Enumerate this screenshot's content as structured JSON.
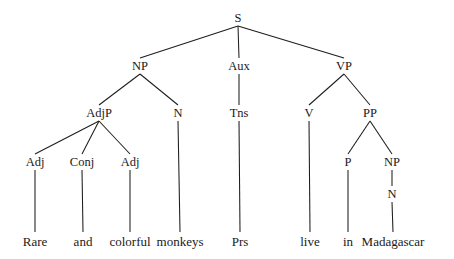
{
  "diagram": {
    "type": "syntax-tree",
    "sentence": "Rare and colorful monkeys Prs live in Madagascar",
    "background_color": "#ffffff",
    "line_color": "#1d1d1d",
    "text_color": "#1a1a1a",
    "width": 454,
    "height": 259,
    "nodes": [
      {
        "id": "S",
        "label": "S",
        "kind": "category",
        "x": 238,
        "y": 18,
        "level": 0
      },
      {
        "id": "NP1",
        "label": "NP",
        "kind": "category",
        "x": 140,
        "y": 66,
        "level": 1
      },
      {
        "id": "Aux",
        "label": "Aux",
        "kind": "category",
        "x": 239,
        "y": 66,
        "level": 1
      },
      {
        "id": "VP",
        "label": "VP",
        "kind": "category",
        "x": 344,
        "y": 66,
        "level": 1
      },
      {
        "id": "AdjP",
        "label": "AdjP",
        "kind": "category",
        "x": 99,
        "y": 113,
        "level": 2
      },
      {
        "id": "N1",
        "label": "N",
        "kind": "category",
        "x": 178,
        "y": 113,
        "level": 2
      },
      {
        "id": "Tns",
        "label": "Tns",
        "kind": "category",
        "x": 239,
        "y": 113,
        "level": 2
      },
      {
        "id": "V",
        "label": "V",
        "kind": "category",
        "x": 309,
        "y": 113,
        "level": 2
      },
      {
        "id": "PP",
        "label": "PP",
        "kind": "category",
        "x": 370,
        "y": 113,
        "level": 2
      },
      {
        "id": "Adj1",
        "label": "Adj",
        "kind": "category",
        "x": 35,
        "y": 162,
        "level": 3
      },
      {
        "id": "Conj",
        "label": "Conj",
        "kind": "category",
        "x": 82,
        "y": 162,
        "level": 3
      },
      {
        "id": "Adj2",
        "label": "Adj",
        "kind": "category",
        "x": 130,
        "y": 162,
        "level": 3
      },
      {
        "id": "P",
        "label": "P",
        "kind": "category",
        "x": 348,
        "y": 162,
        "level": 3
      },
      {
        "id": "NP2",
        "label": "NP",
        "kind": "category",
        "x": 392,
        "y": 162,
        "level": 3
      },
      {
        "id": "N2",
        "label": "N",
        "kind": "category",
        "x": 392,
        "y": 194,
        "level": 4
      },
      {
        "id": "w_rare",
        "label": "Rare",
        "kind": "terminal",
        "x": 35,
        "y": 241,
        "level": 5
      },
      {
        "id": "w_and",
        "label": "and",
        "kind": "terminal",
        "x": 83,
        "y": 241,
        "level": 5
      },
      {
        "id": "w_colorful",
        "label": "colorful",
        "kind": "terminal",
        "x": 130,
        "y": 241,
        "level": 5
      },
      {
        "id": "w_monkeys",
        "label": "monkeys",
        "kind": "terminal",
        "x": 180,
        "y": 241,
        "level": 5
      },
      {
        "id": "w_prs",
        "label": "Prs",
        "kind": "terminal",
        "x": 240,
        "y": 241,
        "level": 5
      },
      {
        "id": "w_live",
        "label": "live",
        "kind": "terminal",
        "x": 310,
        "y": 241,
        "level": 5
      },
      {
        "id": "w_in",
        "label": "in",
        "kind": "terminal",
        "x": 348,
        "y": 241,
        "level": 5
      },
      {
        "id": "w_madagascar",
        "label": "Madagascar",
        "kind": "terminal",
        "x": 393,
        "y": 241,
        "level": 5
      }
    ],
    "edges": [
      {
        "from": "S",
        "to": "NP1",
        "x1": 238,
        "y1": 26,
        "x2": 140,
        "y2": 58
      },
      {
        "from": "S",
        "to": "Aux",
        "x1": 238,
        "y1": 26,
        "x2": 239,
        "y2": 58
      },
      {
        "from": "S",
        "to": "VP",
        "x1": 238,
        "y1": 26,
        "x2": 344,
        "y2": 58
      },
      {
        "from": "NP1",
        "to": "AdjP",
        "x1": 140,
        "y1": 74,
        "x2": 99,
        "y2": 105
      },
      {
        "from": "NP1",
        "to": "N1",
        "x1": 140,
        "y1": 74,
        "x2": 178,
        "y2": 105
      },
      {
        "from": "Aux",
        "to": "Tns",
        "x1": 239,
        "y1": 74,
        "x2": 239,
        "y2": 105
      },
      {
        "from": "VP",
        "to": "V",
        "x1": 344,
        "y1": 74,
        "x2": 309,
        "y2": 105
      },
      {
        "from": "VP",
        "to": "PP",
        "x1": 344,
        "y1": 74,
        "x2": 370,
        "y2": 105
      },
      {
        "from": "AdjP",
        "to": "Adj1",
        "x1": 99,
        "y1": 121,
        "x2": 35,
        "y2": 154
      },
      {
        "from": "AdjP",
        "to": "Conj",
        "x1": 99,
        "y1": 121,
        "x2": 82,
        "y2": 154
      },
      {
        "from": "AdjP",
        "to": "Adj2",
        "x1": 99,
        "y1": 121,
        "x2": 130,
        "y2": 154
      },
      {
        "from": "N1",
        "to": "w_monkeys",
        "x1": 178,
        "y1": 121,
        "x2": 180,
        "y2": 232
      },
      {
        "from": "Tns",
        "to": "w_prs",
        "x1": 239,
        "y1": 121,
        "x2": 240,
        "y2": 232
      },
      {
        "from": "V",
        "to": "w_live",
        "x1": 309,
        "y1": 121,
        "x2": 310,
        "y2": 232
      },
      {
        "from": "PP",
        "to": "P",
        "x1": 370,
        "y1": 121,
        "x2": 348,
        "y2": 154
      },
      {
        "from": "PP",
        "to": "NP2",
        "x1": 370,
        "y1": 121,
        "x2": 392,
        "y2": 154
      },
      {
        "from": "Adj1",
        "to": "w_rare",
        "x1": 35,
        "y1": 170,
        "x2": 35,
        "y2": 232
      },
      {
        "from": "Conj",
        "to": "w_and",
        "x1": 82,
        "y1": 170,
        "x2": 83,
        "y2": 232
      },
      {
        "from": "Adj2",
        "to": "w_colorful",
        "x1": 130,
        "y1": 170,
        "x2": 130,
        "y2": 232
      },
      {
        "from": "P",
        "to": "w_in",
        "x1": 348,
        "y1": 170,
        "x2": 348,
        "y2": 232
      },
      {
        "from": "NP2",
        "to": "N2",
        "x1": 392,
        "y1": 170,
        "x2": 392,
        "y2": 186
      },
      {
        "from": "N2",
        "to": "w_madagascar",
        "x1": 392,
        "y1": 202,
        "x2": 393,
        "y2": 232
      }
    ]
  }
}
